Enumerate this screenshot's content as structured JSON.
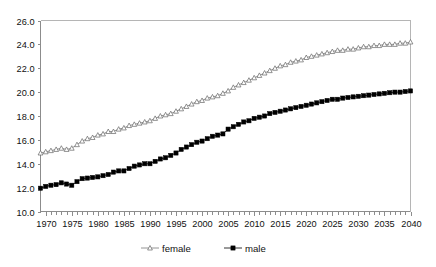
{
  "chart_data": {
    "type": "line",
    "title": "",
    "subtitle": "",
    "xlabel": "",
    "ylabel": "",
    "xlim": [
      1969,
      2040
    ],
    "ylim": [
      10.0,
      26.0
    ],
    "grid": false,
    "legend_position": "bottom",
    "y_ticks": [
      "10.0",
      "12.0",
      "14.0",
      "16.0",
      "18.0",
      "20.0",
      "22.0",
      "24.0",
      "26.0"
    ],
    "y_tick_values": [
      10.0,
      12.0,
      14.0,
      16.0,
      18.0,
      20.0,
      22.0,
      24.0,
      26.0
    ],
    "x_ticks": [
      "1970",
      "1975",
      "1980",
      "1985",
      "1990",
      "1995",
      "2000",
      "2005",
      "2010",
      "2015",
      "2020",
      "2025",
      "2030",
      "2035",
      "2040"
    ],
    "x_tick_values": [
      1970,
      1975,
      1980,
      1985,
      1990,
      1995,
      2000,
      2005,
      2010,
      2015,
      2020,
      2025,
      2030,
      2035,
      2040
    ],
    "x_minor_tick_step": 1,
    "x": [
      1969,
      1970,
      1971,
      1972,
      1973,
      1974,
      1975,
      1976,
      1977,
      1978,
      1979,
      1980,
      1981,
      1982,
      1983,
      1984,
      1985,
      1986,
      1987,
      1988,
      1989,
      1990,
      1991,
      1992,
      1993,
      1994,
      1995,
      1996,
      1997,
      1998,
      1999,
      2000,
      2001,
      2002,
      2003,
      2004,
      2005,
      2006,
      2007,
      2008,
      2009,
      2010,
      2011,
      2012,
      2013,
      2014,
      2015,
      2016,
      2017,
      2018,
      2019,
      2020,
      2021,
      2022,
      2023,
      2024,
      2025,
      2026,
      2027,
      2028,
      2029,
      2030,
      2031,
      2032,
      2033,
      2034,
      2035,
      2036,
      2037,
      2038,
      2039,
      2040
    ],
    "series": [
      {
        "name": "female",
        "marker": "open-triangle",
        "color": "#777777",
        "values": [
          14.9,
          15.0,
          15.1,
          15.2,
          15.3,
          15.2,
          15.3,
          15.6,
          15.9,
          16.1,
          16.2,
          16.4,
          16.5,
          16.7,
          16.7,
          16.9,
          17.0,
          17.2,
          17.3,
          17.4,
          17.5,
          17.6,
          17.8,
          18.0,
          18.1,
          18.2,
          18.4,
          18.6,
          18.8,
          19.0,
          19.2,
          19.3,
          19.5,
          19.6,
          19.7,
          19.9,
          20.1,
          20.4,
          20.6,
          20.8,
          21.0,
          21.2,
          21.4,
          21.6,
          21.8,
          22.0,
          22.2,
          22.3,
          22.5,
          22.6,
          22.7,
          22.9,
          23.0,
          23.1,
          23.2,
          23.3,
          23.4,
          23.5,
          23.5,
          23.6,
          23.6,
          23.7,
          23.8,
          23.8,
          23.9,
          23.9,
          24.0,
          24.0,
          24.0,
          24.1,
          24.1,
          24.2
        ]
      },
      {
        "name": "male",
        "marker": "filled-square",
        "color": "#000000",
        "values": [
          11.95,
          12.1,
          12.2,
          12.25,
          12.4,
          12.3,
          12.2,
          12.5,
          12.75,
          12.8,
          12.85,
          12.9,
          13.0,
          13.1,
          13.3,
          13.4,
          13.4,
          13.6,
          13.8,
          13.9,
          14.0,
          14.0,
          14.2,
          14.4,
          14.5,
          14.7,
          14.9,
          15.2,
          15.4,
          15.6,
          15.8,
          15.9,
          16.1,
          16.3,
          16.4,
          16.5,
          16.9,
          17.1,
          17.3,
          17.5,
          17.6,
          17.8,
          17.9,
          18.0,
          18.2,
          18.3,
          18.4,
          18.5,
          18.6,
          18.7,
          18.8,
          18.9,
          19.0,
          19.1,
          19.2,
          19.3,
          19.4,
          19.4,
          19.5,
          19.55,
          19.6,
          19.65,
          19.7,
          19.75,
          19.8,
          19.85,
          19.9,
          19.95,
          20.0,
          20.0,
          20.05,
          20.1
        ]
      }
    ],
    "legend": [
      {
        "label": "female",
        "marker": "open-triangle"
      },
      {
        "label": "male",
        "marker": "filled-square"
      }
    ]
  }
}
